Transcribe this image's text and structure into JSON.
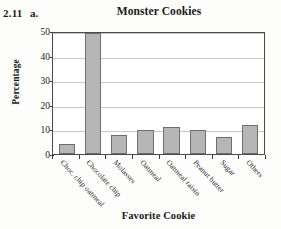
{
  "exercise": {
    "number": "2.11",
    "part": "a."
  },
  "chart_data": {
    "type": "bar",
    "title": "Monster Cookies",
    "xlabel": "Favorite Cookie",
    "ylabel": "Percentage",
    "categories": [
      "Choc. chip oatmeal",
      "Chocolate chip",
      "Molasses",
      "Oatmeal",
      "Oatmeal raisin",
      "Peanut butter",
      "Sugar",
      "Others"
    ],
    "values": [
      4,
      50,
      8,
      10,
      11,
      10,
      7,
      12
    ],
    "ylim": [
      0,
      50
    ],
    "yticks": [
      0,
      10,
      20,
      30,
      40,
      50
    ],
    "ytick_labels": [
      "0",
      "10",
      "20",
      "30",
      "40",
      "50"
    ],
    "grid": true,
    "grid_axis": "y",
    "legend": false,
    "bar_fill_color": "#b6b6b6",
    "bar_edge_color": "#6f6f6f",
    "gridline_color": "#c9c9c9",
    "frame_color": "#4a4a4a"
  }
}
